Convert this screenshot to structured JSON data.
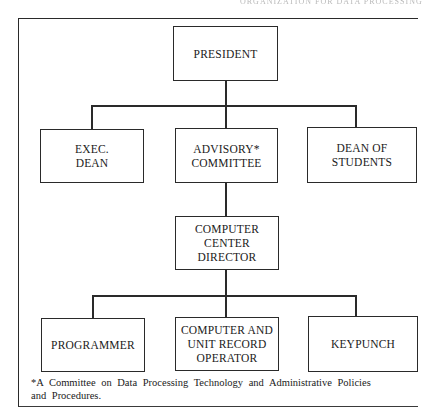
{
  "page": {
    "running_header": "ORGANIZATION FOR DATA PROCESSING"
  },
  "chart": {
    "type": "org-chart",
    "levels": [
      {
        "nodes": [
          {
            "id": "president",
            "label": "PRESIDENT"
          }
        ]
      },
      {
        "nodes": [
          {
            "id": "exec_dean",
            "label": "EXEC.\nDEAN"
          },
          {
            "id": "advisory_committee",
            "label": "ADVISORY*\nCOMMITTEE"
          },
          {
            "id": "dean_of_students",
            "label": "DEAN OF\nSTUDENTS"
          }
        ]
      },
      {
        "nodes": [
          {
            "id": "computer_center_director",
            "label": "COMPUTER\nCENTER\nDIRECTOR"
          }
        ]
      },
      {
        "nodes": [
          {
            "id": "programmer",
            "label": "PROGRAMMER"
          },
          {
            "id": "computer_unit_record_operator",
            "label": "COMPUTER AND\nUNIT RECORD\nOPERATOR"
          },
          {
            "id": "keypunch",
            "label": "KEYPUNCH"
          }
        ]
      }
    ],
    "edges": [
      [
        "president",
        "exec_dean"
      ],
      [
        "president",
        "advisory_committee"
      ],
      [
        "president",
        "dean_of_students"
      ],
      [
        "advisory_committee",
        "computer_center_director"
      ],
      [
        "computer_center_director",
        "programmer"
      ],
      [
        "computer_center_director",
        "computer_unit_record_operator"
      ],
      [
        "computer_center_director",
        "keypunch"
      ]
    ]
  },
  "nodes": {
    "president": "PRESIDENT",
    "exec_dean": "EXEC.\nDEAN",
    "advisory_committee": "ADVISORY*\nCOMMITTEE",
    "dean_of_students": "DEAN OF\nSTUDENTS",
    "computer_center_director": "COMPUTER\nCENTER\nDIRECTOR",
    "programmer": "PROGRAMMER",
    "computer_unit_record_operator": "COMPUTER AND\nUNIT RECORD\nOPERATOR",
    "keypunch": "KEYPUNCH"
  },
  "footnote": {
    "line1": "*A Committee on Data Processing Technology and Administrative Policies",
    "line2": "and Procedures."
  },
  "colors": {
    "line": "#2a2a2a",
    "background": "#ffffff",
    "text": "#1a1a1a"
  }
}
